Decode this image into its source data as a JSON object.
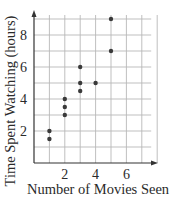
{
  "chart_data": {
    "type": "scatter",
    "title": "",
    "xlabel": "Number of Movies Seen",
    "ylabel": "Time Spent Watching (hours)",
    "xlim": [
      0,
      8
    ],
    "ylim": [
      0,
      9
    ],
    "grid": true,
    "x_ticks": [
      2,
      4,
      6
    ],
    "y_ticks": [
      2,
      4,
      6,
      8
    ],
    "x_tick_labels": [
      "2",
      "4",
      "6"
    ],
    "y_tick_labels": [
      "2",
      "4",
      "6",
      "8"
    ],
    "legend": null,
    "points": [
      {
        "x": 1,
        "y": 1.5
      },
      {
        "x": 1,
        "y": 2
      },
      {
        "x": 2,
        "y": 3
      },
      {
        "x": 2,
        "y": 3.5
      },
      {
        "x": 2,
        "y": 4
      },
      {
        "x": 3,
        "y": 4.5
      },
      {
        "x": 3,
        "y": 5
      },
      {
        "x": 3,
        "y": 6
      },
      {
        "x": 4,
        "y": 5
      },
      {
        "x": 5,
        "y": 7
      },
      {
        "x": 5,
        "y": 9
      }
    ],
    "colors": {
      "point": "#3a3a3a",
      "grid": "#b8b8b8",
      "axis": "#333333"
    }
  }
}
